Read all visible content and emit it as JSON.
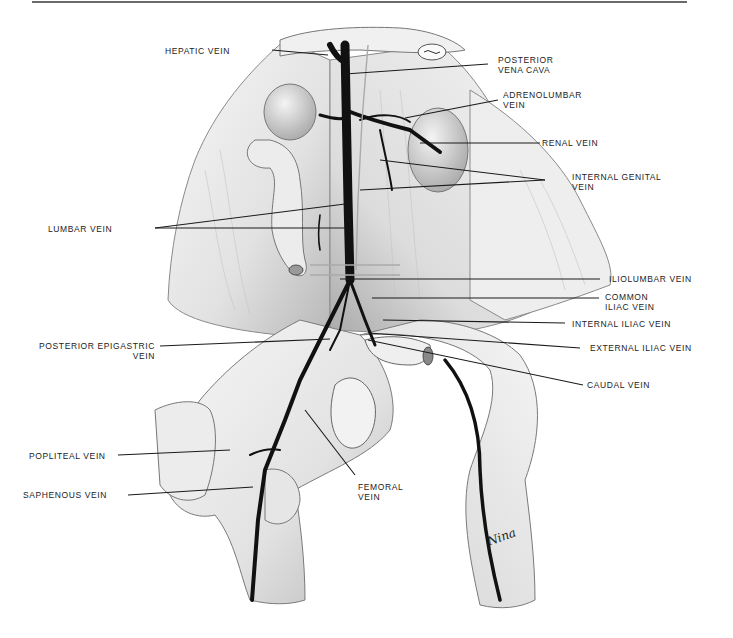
{
  "figure": {
    "signature": "Nina",
    "colors": {
      "ink": "#1a1a1a",
      "vein": "#111111",
      "tissue_light": "#f2f2f2",
      "tissue_mid": "#cfcfcf",
      "tissue_shadow": "#9a9a9a",
      "background": "#ffffff"
    }
  },
  "labels": {
    "hepatic_vein": "HEPATIC VEIN",
    "posterior_vena_cava_1": "POSTERIOR",
    "posterior_vena_cava_2": "VENA CAVA",
    "adrenolumbar_vein_1": "ADRENOLUMBAR",
    "adrenolumbar_vein_2": "VEIN",
    "renal_vein": "RENAL VEIN",
    "internal_genital_vein_1": "INTERNAL GENITAL",
    "internal_genital_vein_2": "VEIN",
    "lumbar_vein": "LUMBAR VEIN",
    "iliolumbar_vein": "ILIOLUMBAR VEIN",
    "common_iliac_vein_1": "COMMON",
    "common_iliac_vein_2": "ILIAC VEIN",
    "internal_iliac_vein": "INTERNAL ILIAC VEIN",
    "posterior_epigastric_vein_1": "POSTERIOR EPIGASTRIC",
    "posterior_epigastric_vein_2": "VEIN",
    "external_iliac_vein": "EXTERNAL ILIAC VEIN",
    "caudal_vein": "CAUDAL VEIN",
    "popliteal_vein": "POPLITEAL VEIN",
    "saphenous_vein": "SAPHENOUS VEIN",
    "femoral_vein_1": "FEMORAL",
    "femoral_vein_2": "VEIN"
  }
}
